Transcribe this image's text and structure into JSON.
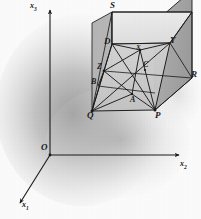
{
  "figure": {
    "background_color": "#fbfbfb",
    "line_color": "#1a1a1a",
    "shadow_color": "#9a9a9a",
    "face_top_color": "#e7e7e7",
    "face_front_color": "#cfcfcf",
    "face_right_color": "#a9a9a9",
    "face_left_color": "#bdbdbd"
  },
  "axes": {
    "x1_label": "x",
    "x1_sub": "1",
    "x2_label": "x",
    "x2_sub": "2",
    "x3_label": "x",
    "x3_sub": "3",
    "origin_label": "O"
  },
  "cube": {
    "vertices": [
      {
        "name": "S",
        "label": "S",
        "x": 112,
        "y": 12
      },
      {
        "name": "Q",
        "label": "Q",
        "x": 92,
        "y": 111
      },
      {
        "name": "P",
        "label": "P",
        "x": 155,
        "y": 110
      },
      {
        "name": "R",
        "label": "R",
        "x": 192,
        "y": 78
      },
      {
        "name": "D",
        "label": "D",
        "x": 112,
        "y": 44
      },
      {
        "name": "Y",
        "label": "Y",
        "x": 170,
        "y": 43
      },
      {
        "name": "Z",
        "label": "Z",
        "x": 104,
        "y": 71
      },
      {
        "name": "C",
        "label": "C",
        "x": 145,
        "y": 70
      },
      {
        "name": "A",
        "label": "A",
        "x": 132,
        "y": 94
      },
      {
        "name": "B",
        "label": "B",
        "x": 98,
        "y": 84
      },
      {
        "name": "X",
        "label": "X",
        "x": 140,
        "y": 50
      }
    ],
    "center_labels": [
      {
        "name": "X",
        "label": "X"
      },
      {
        "name": "A",
        "label": "A"
      },
      {
        "name": "B",
        "label": "B"
      },
      {
        "name": "C",
        "label": "C"
      },
      {
        "name": "D",
        "label": "D"
      },
      {
        "name": "Y",
        "label": "Y"
      },
      {
        "name": "Z",
        "label": "Z"
      }
    ]
  }
}
